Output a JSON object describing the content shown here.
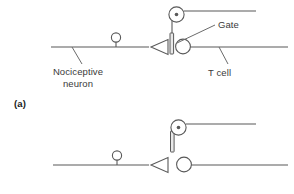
{
  "figure": {
    "panel_label": "(a)",
    "labels": {
      "nociceptive_neuron_line1": "Nociceptive",
      "nociceptive_neuron_line2": "neuron",
      "t_cell": "T cell",
      "gate": "Gate"
    },
    "colors": {
      "stroke": "#595959",
      "text": "#3a3a3a",
      "background": "#ffffff",
      "bar_fill": "#e8e8e8"
    },
    "diagrams": [
      {
        "name": "gate-closed",
        "description": "Upper diagram: gate bar lowered across the T cell axon",
        "gate_state": "closed"
      },
      {
        "name": "gate-open",
        "description": "Lower diagram: gate bar raised above the T cell axon",
        "gate_state": "open"
      }
    ]
  }
}
